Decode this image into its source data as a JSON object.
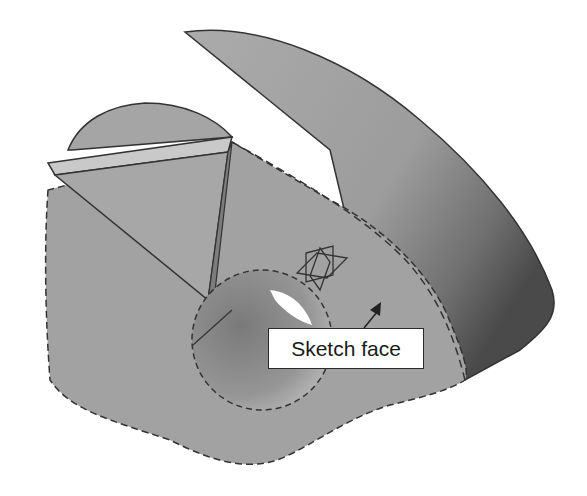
{
  "figure": {
    "type": "3D CAD part illustration",
    "annotation": {
      "label": "Sketch face",
      "arrow_target": "selected planar face"
    },
    "icons": {
      "sketch_plane": "sketch-plane-triad-icon"
    },
    "colors": {
      "background": "#ffffff",
      "face_light": "#a9a9a9",
      "face_mid": "#9a9a9a",
      "face_dark": "#555555",
      "edge": "#333333",
      "highlight_strip": "#c8c8c8",
      "hole_inner": "#8a8a8a"
    }
  }
}
